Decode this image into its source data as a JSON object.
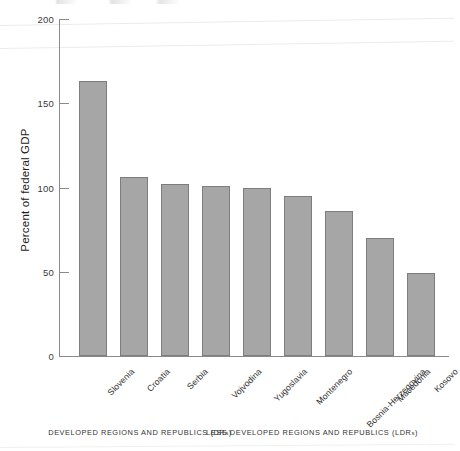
{
  "chart_data": {
    "type": "bar",
    "title": "",
    "subtitle": "",
    "xlabel": "",
    "ylabel": "Percent of federal GDP",
    "ylim": [
      0,
      200
    ],
    "yticks": [
      0,
      50,
      100,
      150,
      200
    ],
    "ytick_labels": [
      "0",
      "50",
      "100",
      "150",
      "200"
    ],
    "grid": false,
    "legend": null,
    "categories": [
      "Slovenia",
      "Croatia",
      "Serbia",
      "Vojvodina",
      "Yugoslavia",
      "Montenegro",
      "Bosnia-Herzegovina",
      "Macedonia",
      "Kosovo"
    ],
    "values": [
      163,
      106,
      102,
      101,
      100,
      95,
      86,
      70,
      49
    ],
    "bar_color": "#a6a6a6",
    "bar_edge_color": "#7d7d7d",
    "annotations": [
      {
        "text": "DEVELOPED REGIONS AND REPUBLICS (DRs)",
        "position": "below-axis-left"
      },
      {
        "text": "LESS DEVELOPED REGIONS AND REPUBLICS (LDRs)",
        "position": "below-axis-right"
      }
    ]
  },
  "axis": {
    "y_title": "Percent of federal GDP",
    "ticks": [
      {
        "label": "200",
        "value": 200
      },
      {
        "label": "150",
        "value": 150
      },
      {
        "label": "100",
        "value": 100
      },
      {
        "label": "50",
        "value": 50
      },
      {
        "label": "0",
        "value": 0
      }
    ]
  },
  "footer": {
    "developed": {
      "main": "DEVELOPED REGIONS AND REPUBLICS (",
      "abbrev": "DR",
      "abbrev_tail": "s",
      "close": ")",
      "full": "DEVELOPED REGIONS AND REPUBLICS (DRs)"
    },
    "less_developed": {
      "main": "LESS DEVELOPED REGIONS AND REPUBLICS (",
      "abbrev": "LDR",
      "abbrev_tail": "s",
      "close": ")",
      "full": "LESS DEVELOPED REGIONS AND REPUBLICS (LDRs)"
    }
  },
  "colors": {
    "bar_fill": "#a6a6a6",
    "bar_stroke": "#7d7d7d",
    "axis": "#8a8a8a",
    "text": "#2b2b2b",
    "background": "#ffffff"
  }
}
